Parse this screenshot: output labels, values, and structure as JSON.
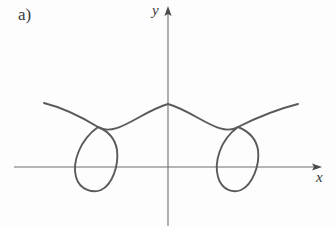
{
  "figure": {
    "panel_label": "a)",
    "background_color": "#fdfdfd",
    "curve_color": "#5a5a5a",
    "axis_color": "#6e6e6e",
    "text_color": "#3a3a3a"
  },
  "axes": {
    "x_axis_label": "x",
    "y_axis_label": "y",
    "x_axis_label_icon": "x-axis-label",
    "y_axis_label_icon": "y-axis-label",
    "origin": {
      "x": 168,
      "y": 167
    },
    "x_axis_start": {
      "x": 14,
      "y": 167
    },
    "x_axis_end": {
      "x": 322,
      "y": 167
    },
    "y_axis_top": {
      "x": 168,
      "y": 6
    },
    "y_axis_bottom": {
      "x": 168,
      "y": 226
    },
    "arrowheads": [
      "x-axis-arrowhead",
      "y-axis-arrowhead"
    ],
    "ticks": [],
    "tick_labels": [],
    "grid": false
  },
  "chart_data": {
    "type": "line",
    "title": "a)",
    "xlabel": "x",
    "ylabel": "y",
    "grid": false,
    "legend": null,
    "symmetry": "even / mirror-symmetric about the y-axis",
    "features": {
      "node_left": {
        "x": 98,
        "y": 127
      },
      "node_right": {
        "x": 238,
        "y": 127
      },
      "arch_apex": {
        "x": 168,
        "y": 104
      },
      "loop_left_bottom": {
        "x": 98,
        "y": 190
      },
      "loop_right_bottom": {
        "x": 238,
        "y": 190
      },
      "loop_left_x_axis_crossings": [
        78,
        117
      ],
      "loop_right_x_axis_crossings": [
        220,
        258
      ],
      "branch_left_end": {
        "x": 44,
        "y": 103
      },
      "branch_right_end": {
        "x": 298,
        "y": 104
      }
    },
    "paths": {
      "outer_branch_left": "M 44 103 C 60 107, 80 116, 98 127 C 116 138, 140 112, 168 104",
      "outer_branch_right": "M 298 104 C 282 108, 260 116, 238 127 C 220 138, 196 112, 168 104",
      "loop_left": "M 98 127 C 78 141, 72 166, 78 180 C 84 194, 112 194, 118 180 C 124 166, 118 141, 98 127",
      "loop_right": "M 238 127 C 218 141, 212 166, 218 180 C 224 194, 252 194, 258 180 C 264 166, 258 141, 238 127"
    },
    "series": [
      {
        "name": "curve",
        "x": [
          44,
          60,
          78,
          98,
          120,
          145,
          168,
          191,
          216,
          238,
          258,
          276,
          298
        ],
        "y": [
          103,
          107,
          116,
          127,
          120,
          109,
          104,
          109,
          120,
          127,
          116,
          107,
          104
        ]
      },
      {
        "name": "loop-left",
        "x": [
          98,
          82,
          76,
          78,
          88,
          98,
          110,
          118,
          119,
          112,
          98
        ],
        "y": [
          127,
          138,
          152,
          167,
          182,
          190,
          184,
          170,
          153,
          138,
          127
        ]
      },
      {
        "name": "loop-right",
        "x": [
          238,
          222,
          216,
          218,
          228,
          238,
          250,
          258,
          259,
          252,
          238
        ],
        "y": [
          127,
          138,
          152,
          167,
          182,
          190,
          184,
          170,
          153,
          138,
          127
        ]
      }
    ],
    "xlim": [
      14,
      322
    ],
    "ylim": [
      226,
      6
    ]
  }
}
